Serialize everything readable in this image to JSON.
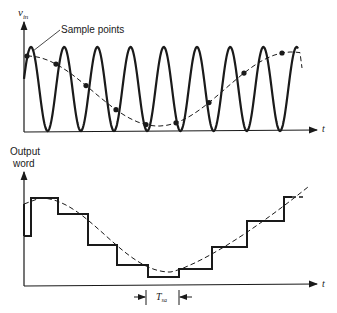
{
  "top_plot": {
    "y_axis_label": "v",
    "y_axis_subscript": "in",
    "x_axis_label": "t",
    "annotation": "Sample points",
    "signal": "high-frequency sine wave",
    "envelope": "dashed slow sinusoid through sample points"
  },
  "bottom_plot": {
    "y_axis_label_line1": "Output",
    "y_axis_label_line2": "word",
    "x_axis_label": "t",
    "period_label": "T",
    "period_subscript": "sa"
  },
  "colors": {
    "ink": "#1a1a1a",
    "background": "#ffffff"
  }
}
